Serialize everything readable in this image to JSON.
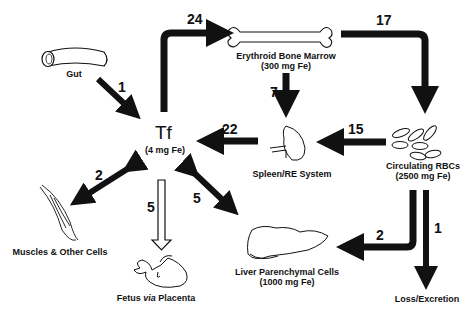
{
  "diagram": {
    "center": {
      "label": "Tf",
      "sublabel": "(4 mg Fe)"
    },
    "nodes": [
      {
        "id": "gut",
        "label": "Gut"
      },
      {
        "id": "bone_marrow",
        "label": "Erythroid Bone Marrow",
        "sublabel": "(300 mg Fe)"
      },
      {
        "id": "rbcs",
        "label": "Circulating RBCs",
        "sublabel": "(2500 mg Fe)"
      },
      {
        "id": "spleen",
        "label": "Spleen/RE System"
      },
      {
        "id": "muscles",
        "label": "Muscles & Other Cells"
      },
      {
        "id": "fetus",
        "label_pre": "Fetus ",
        "label_italic": "via",
        "label_post": " Placenta"
      },
      {
        "id": "liver",
        "label": "Liver Parenchymal Cells",
        "sublabel": "(1000 mg Fe)"
      },
      {
        "id": "loss",
        "label": "Loss/Excretion"
      }
    ],
    "edges": [
      {
        "from": "gut",
        "to": "tf",
        "value": "1"
      },
      {
        "from": "tf",
        "to": "bone_marrow",
        "value": "24"
      },
      {
        "from": "bone_marrow",
        "to": "rbcs",
        "value": "17"
      },
      {
        "from": "bone_marrow",
        "to": "spleen",
        "value": "7"
      },
      {
        "from": "rbcs",
        "to": "spleen",
        "value": "15"
      },
      {
        "from": "spleen",
        "to": "tf",
        "value": "22"
      },
      {
        "from": "tf",
        "to": "muscles",
        "value": "2",
        "bidirectional": true
      },
      {
        "from": "tf",
        "to": "fetus",
        "value": "5",
        "style": "hollow"
      },
      {
        "from": "tf",
        "to": "liver",
        "value": "5",
        "bidirectional": true
      },
      {
        "from": "rbcs",
        "to": "liver",
        "value": "2"
      },
      {
        "from": "rbcs",
        "to": "loss",
        "value": "1"
      }
    ]
  }
}
